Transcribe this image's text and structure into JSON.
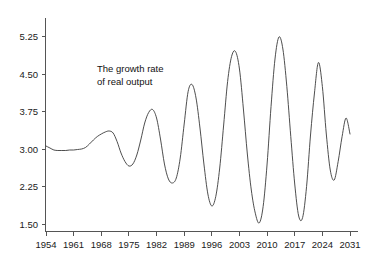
{
  "chart_data": {
    "type": "line",
    "title": "",
    "annotation": "The growth rate\nof real output",
    "annotation_line1": "The growth rate",
    "annotation_line2": "of real output",
    "xlabel": "",
    "ylabel": "",
    "xlim": [
      1954,
      2031
    ],
    "ylim": [
      1.5,
      5.25
    ],
    "grid": false,
    "legend": false,
    "xticks": [
      1954,
      1961,
      1968,
      1975,
      1982,
      1989,
      1996,
      2003,
      2010,
      2017,
      2024,
      2031
    ],
    "xtick_labels": [
      "1954",
      "1961",
      "1968",
      "1975",
      "1982",
      "1989",
      "1996",
      "2003",
      "2010",
      "2017",
      "2024",
      "2031"
    ],
    "yticks": [
      1.5,
      2.25,
      3.0,
      3.75,
      4.5,
      5.25
    ],
    "ytick_labels": [
      "1.50",
      "2.25",
      "3.00",
      "3.75",
      "4.50",
      "5.25"
    ],
    "line_color": "#3a3a3a",
    "background_color": "#ffffff",
    "axis_color": "#555555",
    "series": [
      {
        "name": "The growth rate of real output",
        "x": [
          1954,
          1955,
          1956,
          1957,
          1958,
          1959,
          1960,
          1961,
          1962,
          1963,
          1964,
          1965,
          1966,
          1967,
          1968,
          1969,
          1970,
          1971,
          1972,
          1973,
          1974,
          1975,
          1976,
          1977,
          1978,
          1979,
          1980,
          1981,
          1982,
          1983,
          1984,
          1985,
          1986,
          1987,
          1988,
          1989,
          1990,
          1991,
          1992,
          1993,
          1994,
          1995,
          1996,
          1997,
          1998,
          1999,
          2000,
          2001,
          2002,
          2003,
          2004,
          2005,
          2006,
          2007,
          2008,
          2009,
          2010,
          2011,
          2012,
          2013,
          2014,
          2015,
          2016,
          2017,
          2018,
          2019,
          2020,
          2021,
          2022,
          2023,
          2024,
          2025,
          2026,
          2027,
          2028,
          2029,
          2030,
          2031
        ],
        "values": [
          3.06,
          3.02,
          2.98,
          2.97,
          2.97,
          2.97,
          2.98,
          2.98,
          2.99,
          3.0,
          3.03,
          3.1,
          3.18,
          3.25,
          3.3,
          3.34,
          3.36,
          3.32,
          3.15,
          2.92,
          2.75,
          2.66,
          2.7,
          2.88,
          3.18,
          3.52,
          3.73,
          3.79,
          3.62,
          3.2,
          2.7,
          2.4,
          2.32,
          2.42,
          2.82,
          3.5,
          4.15,
          4.29,
          4.02,
          3.42,
          2.7,
          2.1,
          1.86,
          2.05,
          2.62,
          3.48,
          4.35,
          4.85,
          4.95,
          4.6,
          3.8,
          2.9,
          2.18,
          1.72,
          1.52,
          1.85,
          2.7,
          3.85,
          4.8,
          5.24,
          5.0,
          4.25,
          3.25,
          2.3,
          1.66,
          1.63,
          2.25,
          3.28,
          4.12,
          4.73,
          4.25,
          3.3,
          2.58,
          2.38,
          2.75,
          3.25,
          3.62,
          3.3
        ],
        "key_points": {
          "start_1954": 3.06,
          "early_plateau_1958_1963": 2.97,
          "local_peak_1971": 3.36,
          "trough_1976": 2.66,
          "peak_1981": 3.79,
          "trough_1986": 2.32,
          "peak_1991": 4.29,
          "trough_1996": 1.86,
          "peak_2002": 4.95,
          "trough_2008": 1.52,
          "peak_2013": 5.24,
          "trough_2019": 1.63,
          "peak_2023": 4.73,
          "trough_2027": 2.38,
          "peak_2030": 3.62,
          "end_2031": 3.3
        }
      }
    ]
  }
}
